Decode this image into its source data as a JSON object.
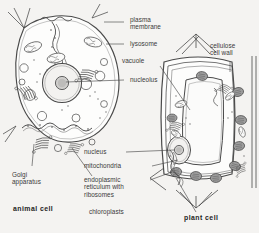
{
  "figure": {
    "type": "biology-diagram",
    "style": "black-and-white line drawing with grey shading",
    "background_color": "#f4f3f1",
    "line_color": "#4a4a4a",
    "text_color": "#3a3a3a"
  },
  "titles": {
    "animal": "animal cell",
    "plant": "plant cell"
  },
  "labels": {
    "plasma_membrane": "plasma\nmembrane",
    "lysosome": "lysosome",
    "vacuole": "vacuole",
    "cellulose_cell_wall": "cellulose\ncell wall",
    "nucleolus": "nucleolus",
    "nucleus": "nucleus",
    "mitochondria": "mitochondria",
    "golgi_apparatus": "Golgi\napparatus",
    "endoplasmic_reticulum": "endoplasmic\nreticulum with\nribosomes",
    "chloroplasts": "chloroplasts"
  },
  "organelles": {
    "animal_cell": [
      "plasma membrane",
      "lysosome",
      "nucleus",
      "nucleolus",
      "mitochondria",
      "Golgi apparatus",
      "endoplasmic reticulum with ribosomes"
    ],
    "plant_cell": [
      "cellulose cell wall",
      "vacuole",
      "nucleus",
      "nucleolus",
      "mitochondria",
      "Golgi apparatus",
      "endoplasmic reticulum with ribosomes",
      "chloroplasts"
    ]
  },
  "colors": {
    "outline": "#4a4a4a",
    "chloroplast_fill": "#9a9a9a",
    "nucleus_fill": "#e8e7e5",
    "nucleolus_fill": "#c9c8c6"
  }
}
